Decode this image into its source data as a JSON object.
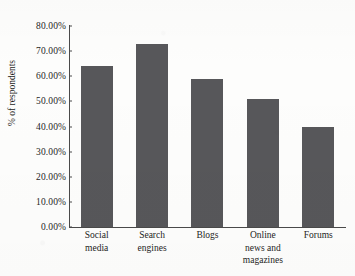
{
  "chart_data": {
    "type": "bar",
    "title": "",
    "xlabel": "",
    "ylabel": "% of respondents",
    "categories": [
      "Social media",
      "Search engines",
      "Blogs",
      "Online news and magazines",
      "Forums"
    ],
    "category_lines": [
      [
        "Social",
        "media"
      ],
      [
        "Search",
        "engines"
      ],
      [
        "Blogs"
      ],
      [
        "Online",
        "news and",
        "magazines"
      ],
      [
        "Forums"
      ]
    ],
    "values": [
      64,
      73,
      59,
      51,
      40
    ],
    "ylim": [
      0,
      80
    ],
    "ytick_values": [
      80,
      70,
      60,
      50,
      40,
      30,
      20,
      10,
      0
    ],
    "ytick_labels": [
      "80.00%",
      "70.00%",
      "60.00%",
      "50.00%",
      "40.00%",
      "30.00%",
      "20.00%",
      "10.00%",
      "0.00%"
    ],
    "grid": false,
    "legend": false,
    "bar_color": "#57575a",
    "axis_color": "#4a4a4a",
    "background_color": "#fdfdfc"
  }
}
